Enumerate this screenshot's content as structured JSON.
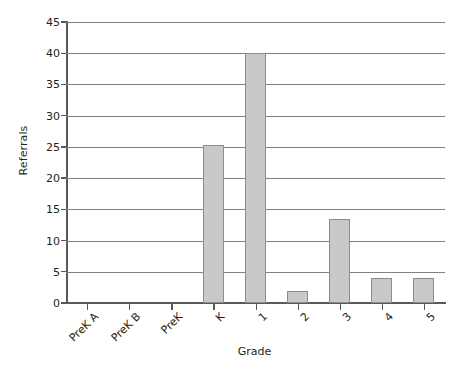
{
  "chart_data": {
    "type": "bar",
    "title": "",
    "xlabel": "Grade",
    "ylabel": "Referrals",
    "categories": [
      "PreK A",
      "PreK B",
      "PreK",
      "K",
      "1",
      "2",
      "3",
      "4",
      "5"
    ],
    "values": [
      0,
      0,
      0,
      25.3,
      40,
      2,
      13.5,
      4,
      4
    ],
    "ylim": [
      0,
      45
    ],
    "ytick_labels": [
      "0",
      "5",
      "10",
      "15",
      "20",
      "25",
      "30",
      "35",
      "40",
      "45"
    ],
    "ytick_values": [
      0,
      5,
      10,
      15,
      20,
      25,
      30,
      35,
      40,
      45
    ],
    "ystep": 5,
    "grid": "horizontal",
    "legend": "none",
    "bar_color": "#c9c9c9",
    "bar_border_color": "#8c8c8c",
    "axis_color": "#58595b",
    "gridline_color": "#808285",
    "xtick_label_rotation": -45
  },
  "figure": {
    "caption_partial": ""
  }
}
